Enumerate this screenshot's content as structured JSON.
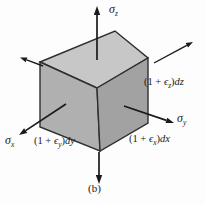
{
  "figure": {
    "caption": "(b)"
  },
  "colors": {
    "face_top": "#c7c7c7",
    "face_left": "#b0b0b0",
    "face_right": "#a2a2a2",
    "edge": "#2f2f2f",
    "arrow": "#1a1a1a"
  },
  "labels": {
    "sigma_z": {
      "symbol": "σ",
      "subscript": "z"
    },
    "sigma_y": {
      "symbol": "σ",
      "subscript": "y"
    },
    "sigma_x": {
      "symbol": "σ",
      "subscript": "x"
    },
    "dim_dz": {
      "open": "(1 + ",
      "epsilon": "ϵ",
      "subscript": "z",
      "close": ")",
      "differential": "dz"
    },
    "dim_dx": {
      "open": "(1 + ",
      "epsilon": "ϵ",
      "subscript": "x",
      "close": ")",
      "differential": "dx"
    },
    "dim_dy": {
      "open": "(1 + ",
      "epsilon": "ϵ",
      "subscript": "y",
      "close": ")",
      "differential": "dy"
    }
  }
}
